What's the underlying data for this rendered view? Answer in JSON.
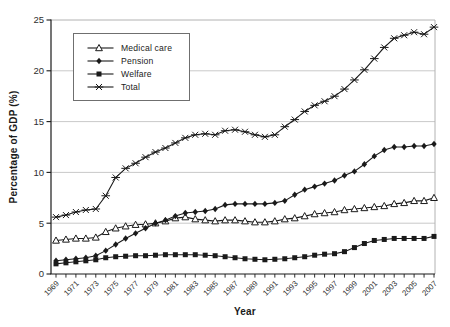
{
  "chart_data": {
    "type": "line",
    "title": "",
    "xlabel": "Year",
    "ylabel": "Percentage of GDP (%)",
    "ylim": [
      0,
      25
    ],
    "y_ticks": [
      0,
      5,
      10,
      15,
      20,
      25
    ],
    "grid": "horizontal-only",
    "legend_position": "upper-left-inside",
    "x": [
      1969,
      1970,
      1971,
      1972,
      1973,
      1974,
      1975,
      1976,
      1977,
      1978,
      1979,
      1980,
      1981,
      1982,
      1983,
      1984,
      1985,
      1986,
      1987,
      1988,
      1989,
      1990,
      1991,
      1992,
      1993,
      1994,
      1995,
      1996,
      1997,
      1998,
      1999,
      2000,
      2001,
      2002,
      2003,
      2004,
      2005,
      2006,
      2007
    ],
    "x_tick_labels": [
      "1969",
      "1971",
      "1973",
      "1975",
      "1977",
      "1979",
      "1981",
      "1983",
      "1985",
      "1987",
      "1989",
      "1991",
      "1993",
      "1995",
      "1997",
      "1999",
      "2001",
      "2003",
      "2005",
      "2007"
    ],
    "series": [
      {
        "name": "Medical care",
        "marker": "open-triangle",
        "values": [
          3.3,
          3.4,
          3.5,
          3.5,
          3.6,
          4.15,
          4.5,
          4.7,
          4.85,
          4.9,
          5.0,
          5.2,
          5.5,
          5.6,
          5.4,
          5.3,
          5.2,
          5.3,
          5.3,
          5.2,
          5.1,
          5.1,
          5.2,
          5.4,
          5.5,
          5.7,
          5.9,
          6.0,
          6.1,
          6.3,
          6.4,
          6.5,
          6.6,
          6.7,
          6.9,
          7.0,
          7.2,
          7.2,
          7.5
        ]
      },
      {
        "name": "Pension",
        "marker": "filled-diamond",
        "values": [
          1.3,
          1.4,
          1.5,
          1.6,
          1.8,
          2.3,
          2.9,
          3.5,
          4.0,
          4.5,
          5.0,
          5.3,
          5.7,
          6.0,
          6.1,
          6.2,
          6.4,
          6.8,
          6.9,
          6.9,
          6.9,
          6.9,
          7.0,
          7.2,
          7.8,
          8.3,
          8.6,
          8.9,
          9.2,
          9.7,
          10.1,
          10.8,
          11.6,
          12.2,
          12.5,
          12.5,
          12.6,
          12.6,
          12.8
        ]
      },
      {
        "name": "Welfare",
        "marker": "filled-square",
        "values": [
          1.0,
          1.1,
          1.2,
          1.3,
          1.4,
          1.6,
          1.7,
          1.75,
          1.8,
          1.8,
          1.85,
          1.9,
          1.9,
          1.9,
          1.9,
          1.85,
          1.8,
          1.7,
          1.6,
          1.5,
          1.45,
          1.4,
          1.45,
          1.5,
          1.6,
          1.7,
          1.85,
          1.95,
          2.0,
          2.2,
          2.6,
          3.0,
          3.3,
          3.4,
          3.5,
          3.5,
          3.5,
          3.5,
          3.7
        ]
      },
      {
        "name": "Total",
        "marker": "asterisk",
        "values": [
          5.6,
          5.8,
          6.1,
          6.3,
          6.4,
          7.7,
          9.5,
          10.4,
          10.9,
          11.5,
          12.0,
          12.4,
          12.9,
          13.4,
          13.7,
          13.8,
          13.7,
          14.1,
          14.2,
          14.0,
          13.7,
          13.5,
          13.7,
          14.5,
          15.2,
          16.0,
          16.6,
          17.0,
          17.5,
          18.2,
          19.1,
          20.1,
          21.2,
          22.3,
          23.2,
          23.5,
          23.8,
          23.6,
          24.3
        ]
      }
    ]
  },
  "colors": {
    "line": "#1a1a1a",
    "grid": "#c9c9c9",
    "frame": "#b2b2b2",
    "tick_text": "#2e2e2e",
    "background": "#ffffff"
  }
}
